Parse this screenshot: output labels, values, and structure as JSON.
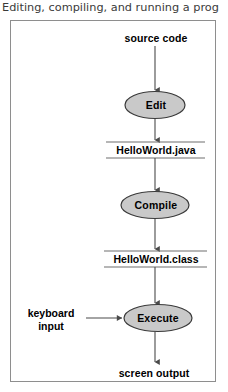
{
  "caption": {
    "text": "Editing, compiling, and running a prog"
  },
  "figure": {
    "frame_border_color": "#8e8e8e",
    "background_color": "#ffffff",
    "ellipse_fill_color": "#c9c9c9",
    "ellipse_stroke_color": "#3a3a3a",
    "line_color": "#4a4a4a",
    "text_color": "#000000"
  },
  "flow": {
    "title": "Editing, compiling, and running a program",
    "type": "flowchart",
    "nodes": [
      {
        "id": "source-code",
        "label": "source code",
        "shape": "text"
      },
      {
        "id": "edit",
        "label": "Edit",
        "shape": "ellipse"
      },
      {
        "id": "helloworld-java",
        "label": "HelloWorld.java",
        "shape": "banded-text"
      },
      {
        "id": "compile",
        "label": "Compile",
        "shape": "ellipse"
      },
      {
        "id": "helloworld-class",
        "label": "HelloWorld.class",
        "shape": "banded-text"
      },
      {
        "id": "keyboard-input",
        "label": "keyboard input",
        "shape": "text"
      },
      {
        "id": "execute",
        "label": "Execute",
        "shape": "ellipse"
      },
      {
        "id": "screen-output",
        "label": "screen output",
        "shape": "text"
      }
    ],
    "edges": [
      {
        "from": "source-code",
        "to": "edit",
        "direction": "down"
      },
      {
        "from": "edit",
        "to": "helloworld-java",
        "direction": "down"
      },
      {
        "from": "helloworld-java",
        "to": "compile",
        "direction": "down"
      },
      {
        "from": "compile",
        "to": "helloworld-class",
        "direction": "down"
      },
      {
        "from": "helloworld-class",
        "to": "execute",
        "direction": "down"
      },
      {
        "from": "keyboard-input",
        "to": "execute",
        "direction": "right"
      },
      {
        "from": "execute",
        "to": "screen-output",
        "direction": "down"
      }
    ],
    "labels": {
      "source_code": "source code",
      "edit": "Edit",
      "helloworld_java": "HelloWorld.java",
      "compile": "Compile",
      "helloworld_class": "HelloWorld.class",
      "keyboard_input_line1": "keyboard",
      "keyboard_input_line2": "input",
      "execute": "Execute",
      "screen_output": "screen output"
    }
  }
}
